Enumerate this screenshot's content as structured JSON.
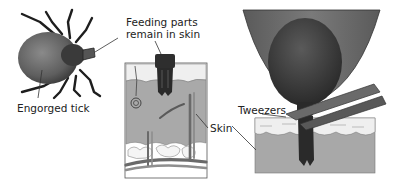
{
  "diagram": {
    "panels": [
      {
        "id": "tick",
        "label": "Engorged tick"
      },
      {
        "id": "skin-section",
        "label": "Feeding parts remain in skin",
        "lines": [
          "Feeding parts",
          "remain in skin"
        ]
      },
      {
        "id": "removal",
        "label": "Tweezers"
      }
    ],
    "labels": {
      "engorged_tick": "Engorged tick",
      "feeding_line1": "Feeding parts",
      "feeding_line2": "remain in skin",
      "skin": "Skin",
      "tweezers": "Tweezers"
    },
    "colors": {
      "tick_body": "#6e6e6e",
      "tick_dark": "#2e2e2e",
      "skin_dermis": "#a8a8a8",
      "skin_epidermis": "#ececec",
      "fat": "#f4f4f4",
      "line": "#333333"
    }
  }
}
